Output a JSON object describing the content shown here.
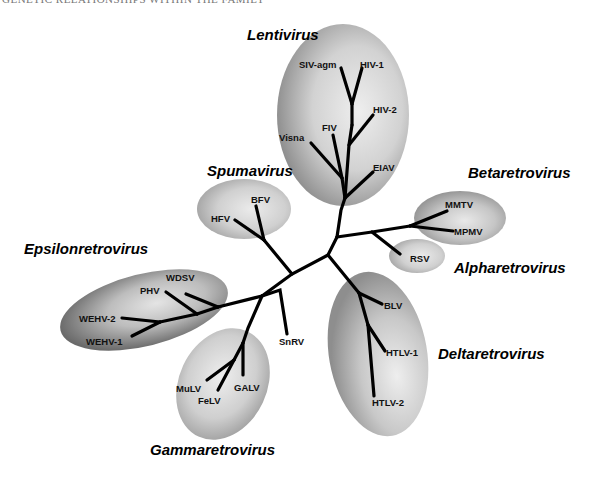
{
  "running_header": "GENETIC RELATIONSHIPS WITHIN THE FAMILY",
  "genera": [
    {
      "id": "lentivirus",
      "label": "Lentivirus",
      "members": [
        "SIV-agm",
        "HIV-1",
        "HIV-2",
        "FIV",
        "Visna",
        "EIAV"
      ]
    },
    {
      "id": "spumavirus",
      "label": "Spumavirus",
      "members": [
        "HFV",
        "BFV"
      ]
    },
    {
      "id": "betaretrovirus",
      "label": "Betaretrovirus",
      "members": [
        "MMTV",
        "MPMV"
      ]
    },
    {
      "id": "alpharetrovirus",
      "label": "Alpharetrovirus",
      "members": [
        "RSV"
      ]
    },
    {
      "id": "epsilonretrovirus",
      "label": "Epsilonretrovirus",
      "members": [
        "WDSV",
        "PHV",
        "WEHV-2",
        "WEHV-1"
      ]
    },
    {
      "id": "deltaretrovirus",
      "label": "Deltaretrovirus",
      "members": [
        "BLV",
        "HTLV-1",
        "HTLV-2"
      ]
    },
    {
      "id": "gammaretrovirus",
      "label": "Gammaretrovirus",
      "members": [
        "MuLV",
        "FeLV",
        "GALV"
      ]
    }
  ],
  "unclassified": [
    "SnRV"
  ],
  "leaves": {
    "siv_agm": "SIV-agm",
    "hiv1": "HIV-1",
    "hiv2": "HIV-2",
    "fiv": "FIV",
    "visna": "Visna",
    "eiav": "EIAV",
    "hfv": "HFV",
    "bfv": "BFV",
    "mmtv": "MMTV",
    "mpmv": "MPMV",
    "rsv": "RSV",
    "wdsv": "WDSV",
    "phv": "PHV",
    "wehv2": "WEHV-2",
    "wehv1": "WEHV-1",
    "snrv": "SnRV",
    "blv": "BLV",
    "htlv1": "HTLV-1",
    "htlv2": "HTLV-2",
    "mulv": "MuLV",
    "felv": "FeLV",
    "galv": "GALV"
  },
  "genus_labels": {
    "lentivirus": "Lentivirus",
    "spumavirus": "Spumavirus",
    "betaretrovirus": "Betaretrovirus",
    "alpharetrovirus": "Alpharetrovirus",
    "epsilonretrovirus": "Epsilonretrovirus",
    "deltaretrovirus": "Deltaretrovirus",
    "gammaretrovirus": "Gammaretrovirus"
  },
  "colors": {
    "ellipse_light": "#ececec",
    "ellipse_dark": "#8a8a8a",
    "branch": "#000000",
    "background": "#ffffff"
  }
}
